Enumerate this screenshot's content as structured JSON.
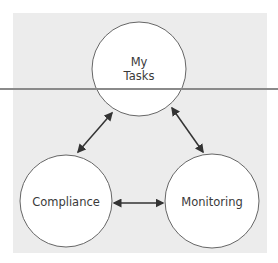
{
  "diagram": {
    "nodes": [
      {
        "id": "my-tasks",
        "label_line1": "My",
        "label_line2": "Tasks"
      },
      {
        "id": "compliance",
        "label": "Compliance"
      },
      {
        "id": "monitoring",
        "label": "Monitoring"
      }
    ],
    "edges": [
      {
        "from": "my-tasks",
        "to": "compliance",
        "type": "bidirectional"
      },
      {
        "from": "my-tasks",
        "to": "monitoring",
        "type": "bidirectional"
      },
      {
        "from": "compliance",
        "to": "monitoring",
        "type": "bidirectional"
      }
    ],
    "colors": {
      "panel": "#ececec",
      "node_fill": "#ffffff",
      "stroke": "#555555",
      "divider": "#8a8a8a"
    }
  }
}
